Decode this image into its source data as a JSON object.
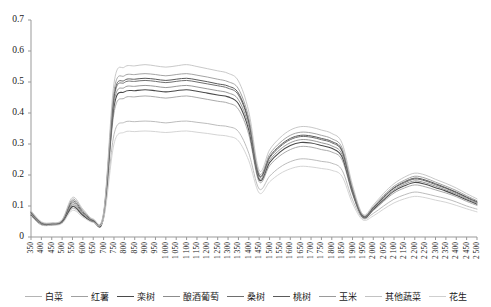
{
  "chart_data": {
    "type": "line",
    "title": "",
    "xlabel": "",
    "ylabel": "",
    "xlim": [
      350,
      2500
    ],
    "ylim": [
      0,
      0.7
    ],
    "grid": false,
    "legend_position": "bottom",
    "y_ticks": [
      "0",
      "0.1",
      "0.2",
      "0.3",
      "0.4",
      "0.5",
      "0.6",
      "0.7"
    ],
    "y_tick_values": [
      0,
      0.1,
      0.2,
      0.3,
      0.4,
      0.5,
      0.6,
      0.7
    ],
    "x_ticks": [
      "350",
      "400",
      "450",
      "500",
      "550",
      "600",
      "650",
      "700",
      "750",
      "800",
      "850",
      "900",
      "950",
      "1 000",
      "1 050",
      "1 100",
      "1 150",
      "1 200",
      "1 250",
      "1 300",
      "1 350",
      "1 400",
      "1 450",
      "1 500",
      "1 550",
      "1 600",
      "1 650",
      "1 700",
      "1 750",
      "1 800",
      "1 850",
      "1 900",
      "1 950",
      "2 000",
      "2 050",
      "2 100",
      "2 150",
      "2 200",
      "2 250",
      "2 300",
      "2 350",
      "2 400",
      "2 450",
      "2 500"
    ],
    "x": [
      350,
      400,
      450,
      500,
      550,
      600,
      650,
      700,
      750,
      800,
      850,
      900,
      950,
      1000,
      1050,
      1100,
      1150,
      1200,
      1250,
      1300,
      1350,
      1400,
      1450,
      1500,
      1550,
      1600,
      1650,
      1700,
      1750,
      1800,
      1850,
      1900,
      1950,
      2000,
      2050,
      2100,
      2150,
      2200,
      2250,
      2300,
      2350,
      2400,
      2450,
      2500
    ],
    "series": [
      {
        "name": "白菜",
        "color": "#b4b4b4",
        "width": 0.9,
        "values": [
          0.075,
          0.042,
          0.04,
          0.046,
          0.092,
          0.068,
          0.05,
          0.062,
          0.33,
          0.37,
          0.372,
          0.374,
          0.372,
          0.368,
          0.372,
          0.374,
          0.37,
          0.366,
          0.36,
          0.356,
          0.34,
          0.27,
          0.155,
          0.196,
          0.225,
          0.243,
          0.252,
          0.25,
          0.244,
          0.238,
          0.215,
          0.12,
          0.06,
          0.076,
          0.1,
          0.122,
          0.136,
          0.145,
          0.14,
          0.132,
          0.124,
          0.113,
          0.1,
          0.09
        ]
      },
      {
        "name": "红薯",
        "color": "#a0a0a0",
        "width": 0.9,
        "values": [
          0.072,
          0.041,
          0.04,
          0.048,
          0.1,
          0.072,
          0.05,
          0.066,
          0.4,
          0.448,
          0.452,
          0.455,
          0.452,
          0.448,
          0.452,
          0.455,
          0.45,
          0.444,
          0.438,
          0.432,
          0.412,
          0.33,
          0.178,
          0.23,
          0.262,
          0.282,
          0.292,
          0.29,
          0.282,
          0.274,
          0.248,
          0.138,
          0.062,
          0.085,
          0.115,
          0.142,
          0.158,
          0.168,
          0.162,
          0.152,
          0.142,
          0.13,
          0.115,
          0.102
        ]
      },
      {
        "name": "栾树",
        "color": "#4a4a4a",
        "width": 1.1,
        "values": [
          0.07,
          0.04,
          0.039,
          0.047,
          0.098,
          0.07,
          0.049,
          0.064,
          0.42,
          0.468,
          0.472,
          0.475,
          0.472,
          0.468,
          0.472,
          0.475,
          0.47,
          0.464,
          0.458,
          0.452,
          0.43,
          0.345,
          0.185,
          0.24,
          0.274,
          0.295,
          0.305,
          0.303,
          0.295,
          0.286,
          0.258,
          0.143,
          0.064,
          0.089,
          0.12,
          0.148,
          0.165,
          0.176,
          0.17,
          0.159,
          0.148,
          0.135,
          0.12,
          0.106
        ]
      },
      {
        "name": "酿酒葡萄",
        "color": "#8c8c8c",
        "width": 0.9,
        "values": [
          0.074,
          0.043,
          0.041,
          0.049,
          0.104,
          0.074,
          0.051,
          0.068,
          0.432,
          0.482,
          0.486,
          0.489,
          0.486,
          0.482,
          0.486,
          0.489,
          0.484,
          0.478,
          0.472,
          0.465,
          0.443,
          0.356,
          0.19,
          0.247,
          0.282,
          0.304,
          0.314,
          0.312,
          0.304,
          0.294,
          0.266,
          0.147,
          0.065,
          0.091,
          0.124,
          0.152,
          0.17,
          0.181,
          0.175,
          0.164,
          0.152,
          0.139,
          0.123,
          0.109
        ]
      },
      {
        "name": "桑树",
        "color": "#6e6e6e",
        "width": 1.0,
        "values": [
          0.078,
          0.045,
          0.042,
          0.05,
          0.11,
          0.078,
          0.053,
          0.07,
          0.448,
          0.498,
          0.502,
          0.505,
          0.502,
          0.498,
          0.502,
          0.505,
          0.5,
          0.494,
          0.488,
          0.48,
          0.458,
          0.368,
          0.196,
          0.255,
          0.291,
          0.314,
          0.324,
          0.322,
          0.314,
          0.304,
          0.275,
          0.152,
          0.067,
          0.094,
          0.128,
          0.157,
          0.175,
          0.187,
          0.181,
          0.169,
          0.157,
          0.143,
          0.127,
          0.112
        ]
      },
      {
        "name": "桃树",
        "color": "#5a5a5a",
        "width": 1.0,
        "values": [
          0.08,
          0.046,
          0.043,
          0.052,
          0.116,
          0.082,
          0.054,
          0.072,
          0.455,
          0.505,
          0.509,
          0.512,
          0.509,
          0.505,
          0.509,
          0.512,
          0.507,
          0.501,
          0.494,
          0.487,
          0.464,
          0.373,
          0.199,
          0.259,
          0.295,
          0.318,
          0.328,
          0.326,
          0.318,
          0.308,
          0.279,
          0.154,
          0.068,
          0.095,
          0.13,
          0.159,
          0.178,
          0.19,
          0.184,
          0.172,
          0.159,
          0.145,
          0.129,
          0.114
        ]
      },
      {
        "name": "玉米",
        "color": "#9a9a9a",
        "width": 0.9,
        "values": [
          0.082,
          0.047,
          0.044,
          0.054,
          0.122,
          0.086,
          0.056,
          0.076,
          0.47,
          0.52,
          0.524,
          0.527,
          0.524,
          0.52,
          0.524,
          0.527,
          0.522,
          0.516,
          0.509,
          0.501,
          0.478,
          0.384,
          0.205,
          0.267,
          0.304,
          0.328,
          0.338,
          0.336,
          0.328,
          0.317,
          0.287,
          0.159,
          0.07,
          0.098,
          0.134,
          0.164,
          0.183,
          0.196,
          0.19,
          0.177,
          0.164,
          0.15,
          0.133,
          0.117
        ]
      },
      {
        "name": "其他蔬菜",
        "color": "#c2c2c2",
        "width": 0.9,
        "values": [
          0.085,
          0.049,
          0.046,
          0.056,
          0.128,
          0.09,
          0.058,
          0.08,
          0.495,
          0.548,
          0.552,
          0.556,
          0.552,
          0.548,
          0.552,
          0.556,
          0.55,
          0.543,
          0.536,
          0.528,
          0.503,
          0.404,
          0.215,
          0.281,
          0.32,
          0.345,
          0.356,
          0.354,
          0.345,
          0.334,
          0.302,
          0.167,
          0.073,
          0.103,
          0.141,
          0.172,
          0.193,
          0.206,
          0.2,
          0.186,
          0.173,
          0.158,
          0.14,
          0.123
        ]
      },
      {
        "name": "花生",
        "color": "#cfcfcf",
        "width": 0.9,
        "values": [
          0.068,
          0.039,
          0.038,
          0.044,
          0.086,
          0.064,
          0.047,
          0.058,
          0.3,
          0.338,
          0.34,
          0.342,
          0.34,
          0.337,
          0.34,
          0.342,
          0.338,
          0.334,
          0.329,
          0.325,
          0.31,
          0.246,
          0.142,
          0.178,
          0.204,
          0.22,
          0.228,
          0.226,
          0.221,
          0.215,
          0.195,
          0.108,
          0.055,
          0.068,
          0.09,
          0.11,
          0.123,
          0.131,
          0.127,
          0.119,
          0.112,
          0.102,
          0.091,
          0.081
        ]
      }
    ]
  },
  "axis": {
    "line_color": "#999999",
    "tick_color": "#999999"
  }
}
